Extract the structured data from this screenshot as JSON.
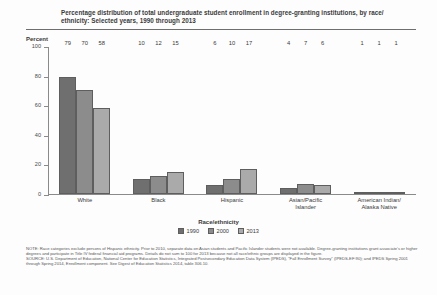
{
  "chart_data": {
    "type": "bar",
    "title_line1": "Percentage distribution of total undergraduate student enrollment in degree-granting institutions, by race/",
    "title_line2": "ethnicity: Selected years, 1990 through 2013",
    "ylabel": "Percent",
    "xlabel": "",
    "legend_title": "Race/ethnicity",
    "legend_position": "bottom",
    "grid": false,
    "ylim": [
      0,
      100
    ],
    "yticks": [
      100,
      80,
      60,
      40,
      20,
      0
    ],
    "categories": [
      "White",
      "Black",
      "Hispanic",
      "Asian/Pacific Islander",
      "American Indian/ Alaska Native"
    ],
    "category_lines": [
      [
        "White"
      ],
      [
        "Black"
      ],
      [
        "Hispanic"
      ],
      [
        "Asian/Pacific",
        "Islander"
      ],
      [
        "American Indian/",
        "Alaska Native"
      ]
    ],
    "series": [
      {
        "name": "1990",
        "color": "#6f6f6f",
        "values": [
          79,
          10,
          6,
          4,
          1
        ]
      },
      {
        "name": "2000",
        "color": "#8c8c8c",
        "values": [
          70,
          12,
          10,
          7,
          1
        ]
      },
      {
        "name": "2013",
        "color": "#aaaaaa",
        "values": [
          58,
          15,
          17,
          6,
          1
        ]
      }
    ]
  },
  "footnotes": {
    "note": "NOTE: Race categories exclude persons of Hispanic ethnicity. Prior to 2010, separate data on Asian students and Pacific Islander students were not available. Degree-granting institutions grant associate's or higher degrees and participate in Title IV federal financial aid programs. Details do not sum to 100 for 2013 because not all race/ethnic groups are displayed in the figure.",
    "source": "SOURCE: U.S. Department of Education, National Center for Education Statistics, Integrated Postsecondary Education Data System (IPEDS), \"Fall Enrollment Survey\" (IPEDS-EF:90); and IPEDS Spring 2001 through Spring 2014, Enrollment component. See Digest of Education Statistics 2014, table 306.10."
  }
}
